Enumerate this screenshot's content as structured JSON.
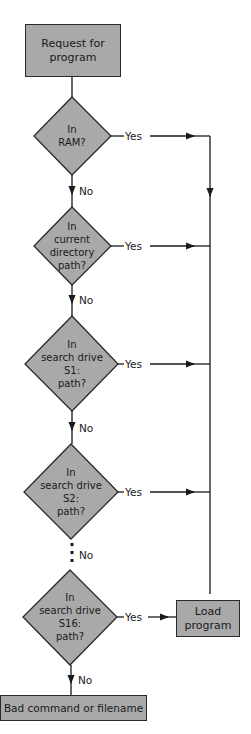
{
  "colors": {
    "fill": "#a9a9a9",
    "stroke": "#2a2a2a",
    "background": "#ffffff"
  },
  "nodes": {
    "start": {
      "label": "Request for\nprogram",
      "line1": "Request for",
      "line2": "program"
    },
    "ram": {
      "line1": "In",
      "line2": "RAM?"
    },
    "current_dir": {
      "line1": "In",
      "line2": "current",
      "line3": "directory",
      "line4": "path?"
    },
    "s1": {
      "line1": "In",
      "line2": "search drive",
      "line3": "S1:",
      "line4": "path?"
    },
    "s2": {
      "line1": "In",
      "line2": "search drive",
      "line3": "S2:",
      "line4": "path?"
    },
    "s16": {
      "line1": "In",
      "line2": "search drive",
      "line3": "S16:",
      "line4": "path?"
    },
    "load": {
      "line1": "Load",
      "line2": "program"
    },
    "error": {
      "label": "Bad command or filename"
    }
  },
  "edges": {
    "yes_label": "Yes",
    "no_label": "No"
  }
}
